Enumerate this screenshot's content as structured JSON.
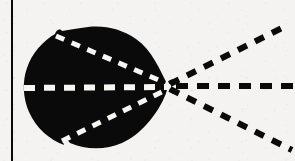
{
  "figure": {
    "title": "Directional radiation pattern with dashed axis rays",
    "background_color": "#f4f3f1",
    "ink_color": "#0a0a0a",
    "highlight_color": "#f7f6f3",
    "canvas": {
      "width": 295,
      "height": 161
    }
  },
  "border_rule": {
    "name": "left vertical rule",
    "x": 11,
    "y_top": 0,
    "y_bottom": 161,
    "thickness": 2,
    "color": "#0a0a0a"
  },
  "lobe": {
    "name": "main black lobe",
    "fill": "#0a0a0a",
    "center_x": 94,
    "center_y": 88,
    "left_edge_x": 24,
    "right_cusp_x": 168,
    "top_edge_y": 28,
    "bottom_edge_y": 149,
    "shape": "cardioid-like filled blob with cusp at right"
  },
  "vertex": {
    "name": "convergence point",
    "x": 168,
    "y": 86
  },
  "rays_inside_lobe": [
    {
      "id": "inner-upper-ray",
      "label": "upper white dashed ray",
      "color": "#f7f6f3",
      "x1": 56,
      "y1": 36,
      "x2": 168,
      "y2": 84,
      "dash": "9 8",
      "width": 5
    },
    {
      "id": "inner-axis-ray",
      "label": "horizontal white dashed axis",
      "color": "#f7f6f3",
      "x1": 24,
      "y1": 88,
      "x2": 168,
      "y2": 87,
      "dash": "11 9",
      "width": 6
    },
    {
      "id": "inner-lower-ray",
      "label": "lower white dashed ray",
      "color": "#f7f6f3",
      "x1": 62,
      "y1": 141,
      "x2": 168,
      "y2": 89,
      "dash": "9 8",
      "width": 5
    }
  ],
  "rays_outside_lobe": [
    {
      "id": "outer-upper-ray",
      "label": "upper black dashed ray",
      "color": "#0a0a0a",
      "x1": 170,
      "y1": 84,
      "x2": 288,
      "y2": 25,
      "dash": "10 9",
      "width": 6
    },
    {
      "id": "outer-axis-ray",
      "label": "horizontal black dashed axis",
      "color": "#0a0a0a",
      "x1": 176,
      "y1": 86,
      "x2": 295,
      "y2": 86,
      "dash": "12 9",
      "width": 6
    },
    {
      "id": "outer-lower-ray",
      "label": "lower black dashed ray",
      "color": "#0a0a0a",
      "x1": 170,
      "y1": 89,
      "x2": 292,
      "y2": 150,
      "dash": "10 9",
      "width": 6
    }
  ],
  "edge_notches": [
    {
      "id": "notch-top-left",
      "x": 60,
      "y": 30
    },
    {
      "id": "notch-bottom-left",
      "x": 66,
      "y": 142
    }
  ],
  "text_labels": []
}
